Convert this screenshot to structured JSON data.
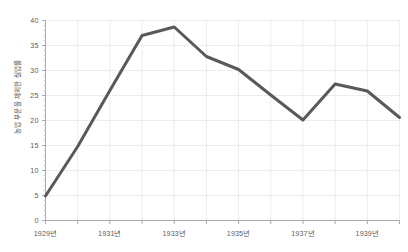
{
  "chart_data": {
    "type": "line",
    "title": "",
    "xlabel": "",
    "ylabel": "농업 부문을 제외한 실업률",
    "xlim": [
      1929,
      1940
    ],
    "ylim": [
      0,
      40
    ],
    "grid": true,
    "legend": "none",
    "line_color": "#595959",
    "grid_color": "#ededed",
    "axis_color": "#a8a8a8",
    "tick_text_color": "#5a5a5a",
    "x": [
      1929,
      1930,
      1931,
      1932,
      1933,
      1934,
      1935,
      1936,
      1937,
      1938,
      1939,
      1940
    ],
    "values": [
      4.9,
      14.8,
      26.0,
      37.0,
      38.7,
      32.8,
      30.2,
      25.1,
      20.1,
      27.3,
      25.9,
      20.6
    ],
    "y_ticks": [
      0,
      5,
      10,
      15,
      20,
      25,
      30,
      35,
      40
    ],
    "y_tick_labels": [
      "0",
      "5",
      "10",
      "15",
      "20",
      "25",
      "30",
      "35",
      "40"
    ],
    "x_ticks": [
      1929,
      1931,
      1933,
      1935,
      1937,
      1939
    ],
    "x_tick_labels": [
      "1929년",
      "1931년",
      "1933년",
      "1935년",
      "1937년",
      "1939년"
    ],
    "x_minor_ticks": [
      1930,
      1932,
      1934,
      1936,
      1938,
      1940
    ]
  }
}
